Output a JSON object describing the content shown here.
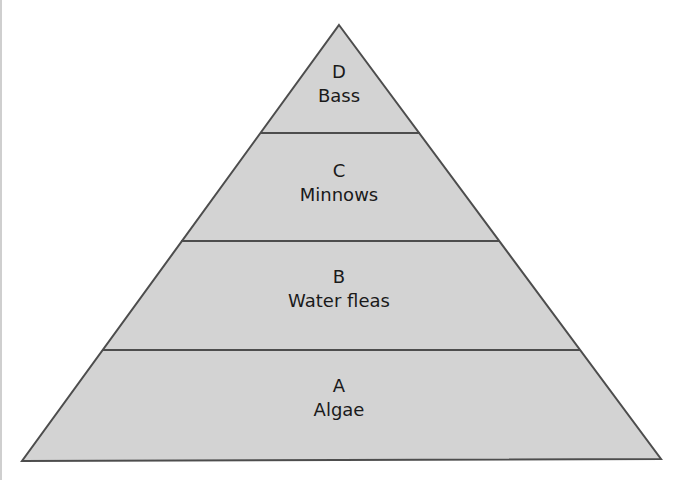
{
  "diagram": {
    "type": "food-pyramid",
    "colors": {
      "fill": "#d3d3d3",
      "stroke": "#4d4d4d",
      "text": "#1a1a1a"
    },
    "levels": [
      {
        "letter": "D",
        "name": "Bass"
      },
      {
        "letter": "C",
        "name": "Minnows"
      },
      {
        "letter": "B",
        "name": "Water fleas"
      },
      {
        "letter": "A",
        "name": "Algae"
      }
    ]
  }
}
